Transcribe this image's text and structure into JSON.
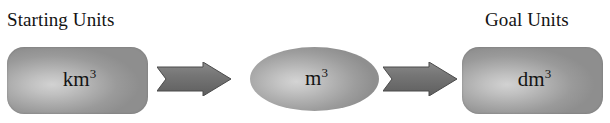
{
  "diagram": {
    "type": "flow",
    "background_color": "#ffffff",
    "labels": {
      "start_caption": "Starting Units",
      "goal_caption": "Goal Units"
    },
    "nodes": [
      {
        "id": "start",
        "shape": "rounded-rectangle",
        "base": "km",
        "exponent": "3",
        "full_text": "km3",
        "fill_color": "#ababab"
      },
      {
        "id": "middle",
        "shape": "ellipse",
        "base": "m",
        "exponent": "3",
        "full_text": "m3",
        "fill_color": "#b0b0b0"
      },
      {
        "id": "goal",
        "shape": "rounded-rectangle",
        "base": "dm",
        "exponent": "3",
        "full_text": "dm3",
        "fill_color": "#ababab"
      }
    ],
    "arrows": [
      {
        "id": "arrow-1",
        "from": "start",
        "to": "middle",
        "direction": "right",
        "fill_color": "#6e6e6e"
      },
      {
        "id": "arrow-2",
        "from": "middle",
        "to": "goal",
        "direction": "right",
        "fill_color": "#6e6e6e"
      }
    ]
  }
}
